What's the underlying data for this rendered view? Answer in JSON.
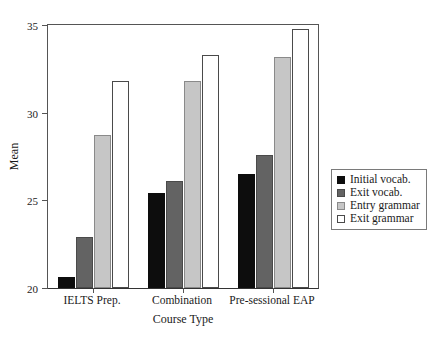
{
  "figure": {
    "clipped_top_title": "",
    "background": "#ffffff"
  },
  "chart_data": {
    "type": "bar",
    "title": "",
    "xlabel": "Course Type",
    "ylabel": "Mean",
    "categories": [
      "IELTS Prep.",
      "Combination",
      "Pre-sessional EAP"
    ],
    "series": [
      {
        "name": "Initial vocab.",
        "color": "#0d0d0d",
        "values": [
          20.6,
          25.4,
          26.5
        ]
      },
      {
        "name": "Exit vocab.",
        "color": "#636363",
        "values": [
          22.9,
          26.1,
          27.6
        ]
      },
      {
        "name": "Entry grammar",
        "color": "#c6c6c6",
        "values": [
          28.7,
          31.8,
          33.2
        ]
      },
      {
        "name": "Exit grammar",
        "color": "#ffffff",
        "values": [
          31.8,
          33.3,
          34.8
        ]
      }
    ],
    "ylim": [
      20,
      35
    ],
    "yticks": [
      20,
      25,
      30,
      35
    ],
    "ytick_labels": [
      "20",
      "25",
      "30",
      "35"
    ],
    "grid": false,
    "legend_position": "right"
  },
  "legend": {
    "items": [
      {
        "label": "Initial vocab."
      },
      {
        "label": "Exit vocab."
      },
      {
        "label": "Entry grammar"
      },
      {
        "label": "Exit grammar"
      }
    ]
  }
}
